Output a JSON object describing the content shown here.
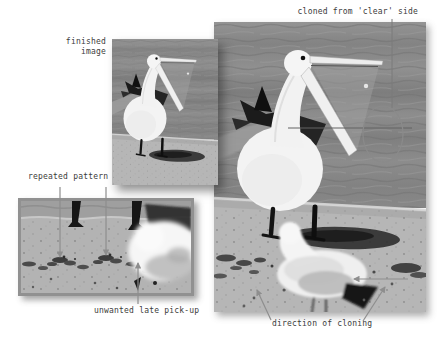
{
  "canvas": {
    "width": 437,
    "height": 339,
    "background": "#ffffff"
  },
  "annotations": {
    "cloned_from_clear_side": "cloned from 'clear' side",
    "finished_image": {
      "line1": "finished",
      "line2": "image"
    },
    "repeated_pattern": "repeated pattern",
    "unwanted_late_pickup": "unwanted late pick-up",
    "direction_of_cloning": "direction of cloning"
  },
  "images": {
    "working_large": "pelican on shoreline with gull (working image)",
    "finished_thumbnail": "pelican on shoreline, gull removed (finished image)",
    "detail_crop": "magnified shoreline strip showing repeated debris pattern and gull"
  },
  "colors": {
    "label_text": "#3b3b3b",
    "arrow_gray": "#8e8e8e",
    "line_gray": "#636363",
    "circle_gray": "#8a8a8a",
    "crop_frame": "#919191",
    "water": "#868686",
    "sand": "#b6b6b6"
  }
}
